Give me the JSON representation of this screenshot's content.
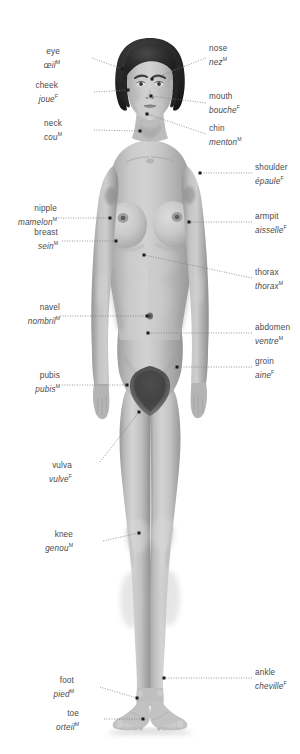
{
  "figure": {
    "background_color": "#ffffff",
    "skin_tone": "#b9b9b9",
    "hair_color": "#2a2a2a",
    "label_color": "#4a4a4a",
    "leader_color": "#777777",
    "marker_color": "#1a1a1a"
  },
  "labels": [
    {
      "id": "eye",
      "en": "eye",
      "fr": "œil",
      "gender": "M",
      "side": "left",
      "text_x": 60,
      "text_y": 47,
      "line": [
        [
          92,
          58
        ],
        [
          122,
          69
        ]
      ],
      "marker": [
        122,
        69
      ]
    },
    {
      "id": "nose",
      "en": "nose",
      "fr": "nez",
      "gender": "M",
      "side": "right",
      "text_x": 209,
      "text_y": 44,
      "line": [
        [
          206,
          58
        ],
        [
          152,
          79
        ]
      ],
      "marker": [
        152,
        79
      ]
    },
    {
      "id": "cheek",
      "en": "cheek",
      "fr": "joue",
      "gender": "F",
      "side": "left",
      "text_x": 58,
      "text_y": 81,
      "line": [
        [
          94,
          92
        ],
        [
          128,
          90
        ]
      ],
      "marker": [
        128,
        90
      ]
    },
    {
      "id": "mouth",
      "en": "mouth",
      "fr": "bouche",
      "gender": "F",
      "side": "right",
      "text_x": 209,
      "text_y": 92,
      "line": [
        [
          206,
          103
        ],
        [
          151,
          96
        ]
      ],
      "marker": [
        151,
        96
      ]
    },
    {
      "id": "neck",
      "en": "neck",
      "fr": "cou",
      "gender": "M",
      "side": "left",
      "text_x": 62,
      "text_y": 119,
      "line": [
        [
          94,
          130
        ],
        [
          140,
          131
        ]
      ],
      "marker": [
        140,
        131
      ]
    },
    {
      "id": "chin",
      "en": "chin",
      "fr": "menton",
      "gender": "M",
      "side": "right",
      "text_x": 209,
      "text_y": 124,
      "line": [
        [
          206,
          134
        ],
        [
          147,
          114
        ]
      ],
      "marker": [
        147,
        114
      ]
    },
    {
      "id": "shoulder",
      "en": "shoulder",
      "fr": "épaule",
      "gender": "F",
      "side": "right",
      "text_x": 255,
      "text_y": 163,
      "line": [
        [
          252,
          173
        ],
        [
          200,
          173
        ]
      ],
      "marker": [
        200,
        173
      ]
    },
    {
      "id": "nipple",
      "en": "nipple",
      "fr": "mamelon",
      "gender": "M",
      "side": "left",
      "text_x": 57,
      "text_y": 204,
      "line": [
        [
          58,
          218
        ],
        [
          110,
          218
        ]
      ],
      "marker": [
        110,
        218
      ]
    },
    {
      "id": "armpit",
      "en": "armpit",
      "fr": "aisselle",
      "gender": "F",
      "side": "right",
      "text_x": 255,
      "text_y": 212,
      "line": [
        [
          252,
          222
        ],
        [
          189,
          222
        ]
      ],
      "marker": [
        189,
        222
      ]
    },
    {
      "id": "breast",
      "en": "breast",
      "fr": "sein",
      "gender": "M",
      "side": "left",
      "text_x": 58,
      "text_y": 228,
      "line": [
        [
          62,
          241
        ],
        [
          116,
          241
        ]
      ],
      "marker": [
        116,
        241
      ]
    },
    {
      "id": "thorax",
      "en": "thorax",
      "fr": "thorax",
      "gender": "M",
      "side": "right",
      "text_x": 255,
      "text_y": 268,
      "line": [
        [
          252,
          278
        ],
        [
          144,
          255
        ]
      ],
      "marker": [
        144,
        255
      ]
    },
    {
      "id": "navel",
      "en": "navel",
      "fr": "nombril",
      "gender": "M",
      "side": "left",
      "text_x": 60,
      "text_y": 303,
      "line": [
        [
          60,
          316
        ],
        [
          147,
          316
        ]
      ],
      "marker": [
        147,
        316
      ]
    },
    {
      "id": "abdomen",
      "en": "abdomen",
      "fr": "ventre",
      "gender": "M",
      "side": "right",
      "text_x": 255,
      "text_y": 323,
      "line": [
        [
          252,
          333
        ],
        [
          148,
          333
        ]
      ],
      "marker": [
        148,
        333
      ]
    },
    {
      "id": "groin",
      "en": "groin",
      "fr": "aine",
      "gender": "F",
      "side": "right",
      "text_x": 255,
      "text_y": 357,
      "line": [
        [
          252,
          367
        ],
        [
          177,
          367
        ]
      ],
      "marker": [
        177,
        367
      ]
    },
    {
      "id": "pubis",
      "en": "pubis",
      "fr": "pubis",
      "gender": "M",
      "side": "left",
      "text_x": 60,
      "text_y": 371,
      "line": [
        [
          62,
          385
        ],
        [
          127,
          385
        ]
      ],
      "marker": [
        127,
        385
      ]
    },
    {
      "id": "vulva",
      "en": "vulva",
      "fr": "vulve",
      "gender": "F",
      "side": "left",
      "text_x": 72,
      "text_y": 461,
      "line": [
        [
          100,
          462
        ],
        [
          139,
          412
        ]
      ],
      "marker": [
        139,
        412
      ]
    },
    {
      "id": "knee",
      "en": "knee",
      "fr": "genou",
      "gender": "M",
      "side": "left",
      "text_x": 73,
      "text_y": 530,
      "line": [
        [
          103,
          541
        ],
        [
          139,
          533
        ]
      ],
      "marker": [
        139,
        533
      ]
    },
    {
      "id": "foot",
      "en": "foot",
      "fr": "pied",
      "gender": "M",
      "side": "left",
      "text_x": 74,
      "text_y": 676,
      "line": [
        [
          100,
          687
        ],
        [
          137,
          698
        ]
      ],
      "marker": [
        137,
        698
      ]
    },
    {
      "id": "ankle",
      "en": "ankle",
      "fr": "cheville",
      "gender": "F",
      "side": "right",
      "text_x": 255,
      "text_y": 668,
      "line": [
        [
          252,
          678
        ],
        [
          164,
          678
        ]
      ],
      "marker": [
        164,
        678
      ]
    },
    {
      "id": "toe",
      "en": "toe",
      "fr": "orteil",
      "gender": "M",
      "side": "left",
      "text_x": 79,
      "text_y": 709,
      "line": [
        [
          104,
          719
        ],
        [
          143,
          719
        ]
      ],
      "marker": [
        143,
        719
      ]
    }
  ]
}
